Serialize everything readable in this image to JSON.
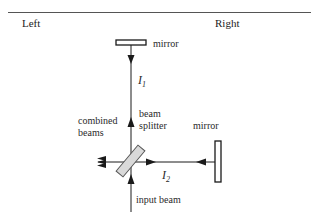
{
  "header": {
    "left_label": "Left",
    "right_label": "Right"
  },
  "diagram": {
    "labels": {
      "top_mirror": "mirror",
      "right_mirror": "mirror",
      "beam_splitter_line1": "beam",
      "beam_splitter_line2": "splitter",
      "combined_line1": "combined",
      "combined_line2": "beams",
      "input_beam": "input beam",
      "intensity_1": "I",
      "intensity_1_sub": "1",
      "intensity_2": "I",
      "intensity_2_sub": "2"
    },
    "colors": {
      "line": "#1a1a1a",
      "splitter_fill": "#d9d9d9",
      "mirror_fill": "#ffffff"
    }
  }
}
